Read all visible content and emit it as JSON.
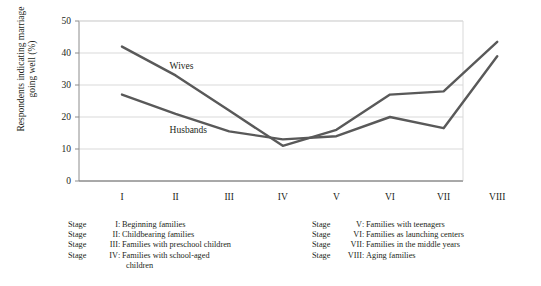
{
  "chart_data": {
    "type": "line",
    "title": "",
    "xlabel": "",
    "ylabel": "Respondents indicating marriage going well (%)",
    "categories": [
      "I",
      "II",
      "III",
      "IV",
      "V",
      "VI",
      "VII",
      "VIII"
    ],
    "ylim": [
      0,
      50
    ],
    "yticks": [
      0,
      10,
      20,
      30,
      40,
      50
    ],
    "grid": true,
    "legend_position": "inline-labels",
    "series": [
      {
        "name": "Wives",
        "color": "#595959",
        "values": [
          42,
          33,
          22,
          11,
          16,
          27,
          28,
          43.5
        ]
      },
      {
        "name": "Husbands",
        "color": "#595959",
        "values": [
          27,
          21,
          15.5,
          13,
          14,
          20,
          16.5,
          39
        ]
      }
    ],
    "annotations": [
      {
        "text": "Wives",
        "x_category": "II",
        "value": 36
      },
      {
        "text": "Husbands",
        "x_category": "II",
        "value": 16
      }
    ]
  },
  "axis": {
    "y_tick_labels": [
      "50",
      "40",
      "30",
      "20",
      "10",
      "0"
    ],
    "x_tick_labels": [
      "I",
      "II",
      "III",
      "IV",
      "V",
      "VI",
      "VII",
      "VIII"
    ],
    "y_axis_title_line1": "Respondents indicating marriage",
    "y_axis_title_line2": "going well (%)"
  },
  "legend": {
    "left_column": [
      {
        "stage": "Stage",
        "numeral": "I",
        "colon": ":",
        "text": "Beginning families",
        "continuation": ""
      },
      {
        "stage": "Stage",
        "numeral": "II",
        "colon": ":",
        "text": "Childbearing families",
        "continuation": ""
      },
      {
        "stage": "Stage",
        "numeral": "III",
        "colon": ":",
        "text": "Families with preschool children",
        "continuation": ""
      },
      {
        "stage": "Stage",
        "numeral": "IV",
        "colon": ":",
        "text": "Families with school-aged",
        "continuation": "children"
      }
    ],
    "right_column": [
      {
        "stage": "Stage",
        "numeral": "V",
        "colon": ":",
        "text": "Families with teenagers",
        "continuation": ""
      },
      {
        "stage": "Stage",
        "numeral": "VI",
        "colon": ":",
        "text": "Families as launching centers",
        "continuation": ""
      },
      {
        "stage": "Stage",
        "numeral": "VII",
        "colon": ":",
        "text": "Families in the middle years",
        "continuation": ""
      },
      {
        "stage": "Stage",
        "numeral": "VIII",
        "colon": ":",
        "text": "Aging families",
        "continuation": ""
      }
    ]
  },
  "colors": {
    "line": "#595959",
    "grid": "#d9d9d9",
    "axis": "#8c8c8c",
    "text": "#231f20",
    "background": "#ffffff"
  }
}
